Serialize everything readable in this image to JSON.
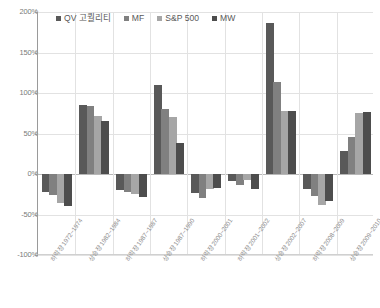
{
  "chart_data": {
    "type": "bar",
    "title": "",
    "xlabel": "",
    "ylabel": "",
    "ylim": [
      -100,
      200
    ],
    "grid": true,
    "legend_position": "top-left",
    "y_ticks": [
      "200%",
      "150%",
      "100%",
      "50%",
      "0%",
      "-50%",
      "-100%"
    ],
    "y_tick_values": [
      200,
      150,
      100,
      50,
      0,
      -50,
      -100
    ],
    "categories": [
      "하락장 1972~1974",
      "상승장 1982~1984",
      "하락장 1987~1987",
      "상승장 1987~1990",
      "하락장 2000~2001",
      "하락장 2001~2002",
      "상승장 2002~2007",
      "하락장 2008~2009",
      "상승장 2009~2010"
    ],
    "series": [
      {
        "name": "QV 고퀄리티",
        "color": "#595959",
        "values": [
          -22,
          85,
          -20,
          110,
          -23,
          -9,
          187,
          -19,
          29
        ]
      },
      {
        "name": "MF",
        "color": "#808080",
        "values": [
          -26,
          84,
          -22,
          80,
          -30,
          -14,
          113,
          -27,
          46
        ]
      },
      {
        "name": "S&P 500",
        "color": "#a6a6a6",
        "values": [
          -36,
          72,
          -25,
          70,
          -18,
          -7,
          78,
          -38,
          75
        ]
      },
      {
        "name": "MW",
        "color": "#4d4d4d",
        "values": [
          -40,
          65,
          -28,
          38,
          -17,
          -19,
          78,
          -33,
          76
        ]
      }
    ]
  },
  "legend": {
    "items": [
      {
        "label": "QV 고퀄리티",
        "color": "#595959"
      },
      {
        "label": "MF",
        "color": "#808080"
      },
      {
        "label": "S&P 500",
        "color": "#a6a6a6"
      },
      {
        "label": "MW",
        "color": "#4d4d4d"
      }
    ]
  }
}
